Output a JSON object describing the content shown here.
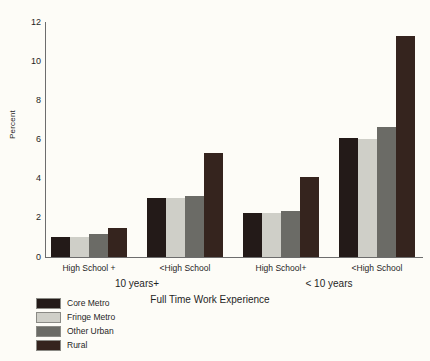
{
  "chart_data": {
    "type": "bar",
    "title": "",
    "xlabel": "Full Time Work Experience",
    "ylabel": "Percent",
    "ylim": [
      0,
      12
    ],
    "yticks": [
      0,
      2,
      4,
      6,
      8,
      10,
      12
    ],
    "grid": false,
    "legend_position": "bottom-left",
    "categories": [
      "High School +",
      "<High School",
      "High School+",
      "<High School"
    ],
    "group_labels": [
      "10 years+",
      "< 10 years"
    ],
    "series": [
      {
        "name": "Core Metro",
        "color": "#231a18",
        "values": [
          1.0,
          3.0,
          2.25,
          6.1
        ]
      },
      {
        "name": "Fringe Metro",
        "color": "#cfcfc8",
        "values": [
          1.0,
          3.0,
          2.25,
          6.05
        ]
      },
      {
        "name": "Other Urban",
        "color": "#6b6b66",
        "values": [
          1.15,
          3.1,
          2.35,
          6.65
        ]
      },
      {
        "name": "Rural",
        "color": "#35241e",
        "values": [
          1.5,
          5.3,
          4.1,
          11.3
        ]
      }
    ]
  }
}
